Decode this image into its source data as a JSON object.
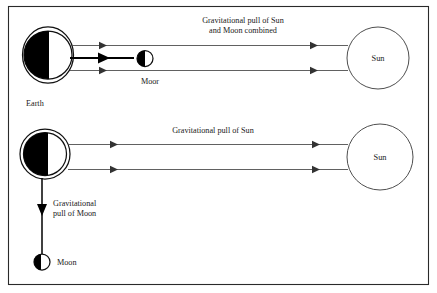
{
  "figure": {
    "background_color": "#ffffff",
    "border_color": "#2a2a2a",
    "ink_color": "#000000"
  },
  "panels": [
    {
      "id": "spring-tide",
      "label": "Sun and Moon aligned",
      "bodies": {
        "earth": {
          "name": "Earth",
          "label": "Earth",
          "shaded_half": "left"
        },
        "moon": {
          "name": "Moon",
          "label": "Moor",
          "shaded_half": "left"
        },
        "sun": {
          "name": "Sun",
          "label": "Sun"
        }
      },
      "annotations": [
        {
          "name": "combined-pull-label",
          "line1": "Gravitational pull of Sun",
          "line2": "and Moon combined"
        }
      ]
    },
    {
      "id": "neap-tide",
      "label": "Sun and Moon at right angles",
      "bodies": {
        "earth": {
          "name": "Earth",
          "label": "",
          "shaded_half": "left"
        },
        "moon": {
          "name": "Moon",
          "label": "Moon",
          "shaded_half": "left"
        },
        "sun": {
          "name": "Sun",
          "label": "Sun"
        }
      },
      "annotations": [
        {
          "name": "sun-pull-label",
          "line1": "Gravitational pull of Sun",
          "line2": ""
        },
        {
          "name": "moon-pull-label",
          "line1": "Gravitational",
          "line2": "pull of Moon"
        }
      ]
    }
  ]
}
